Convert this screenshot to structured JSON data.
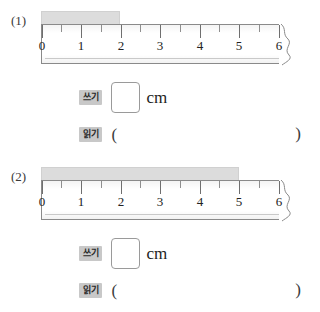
{
  "worksheet": {
    "ruler": {
      "tick_labels": [
        "0",
        "1",
        "2",
        "3",
        "4",
        "5",
        "6"
      ],
      "min": 0,
      "max": 6,
      "minor_step": 0.5,
      "break_marker": "zigzag-break"
    },
    "labels": {
      "write_tag": "쓰기",
      "read_tag": "읽기",
      "unit": "cm",
      "paren_open": "(",
      "paren_close": ")"
    },
    "problems": [
      {
        "index": "(1)",
        "bar_start": 0,
        "bar_end": 2,
        "write_value": "",
        "read_value": ""
      },
      {
        "index": "(2)",
        "bar_start": 0,
        "bar_end": 5,
        "write_value": "",
        "read_value": ""
      }
    ]
  },
  "colors": {
    "bar_fill": "#dcdcdc",
    "tag_bg": "#c8c8c8",
    "ruler_border": "#8a8a8a",
    "text": "#231f20"
  }
}
